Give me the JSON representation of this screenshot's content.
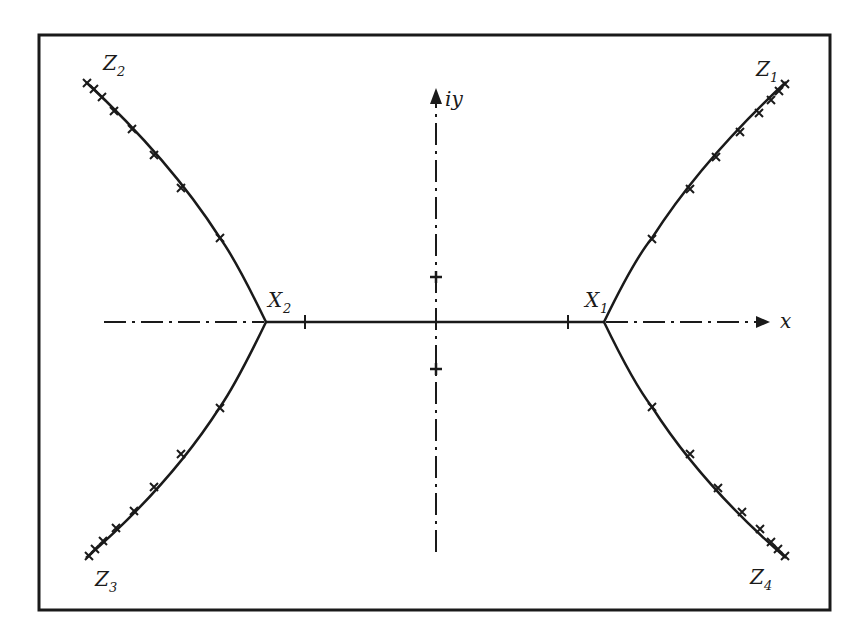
{
  "diagram": {
    "type": "complex-plane branch curves",
    "axes": {
      "x_label": "x",
      "y_label": "iy"
    },
    "points": {
      "X1": {
        "label": "X",
        "sub": "1"
      },
      "X2": {
        "label": "X",
        "sub": "2"
      },
      "Z1": {
        "label": "Z",
        "sub": "1"
      },
      "Z2": {
        "label": "Z",
        "sub": "2"
      },
      "Z3": {
        "label": "Z",
        "sub": "3"
      },
      "Z4": {
        "label": "Z",
        "sub": "4"
      }
    },
    "colors": {
      "ink": "#1a1a1a",
      "background": "#ffffff"
    }
  }
}
